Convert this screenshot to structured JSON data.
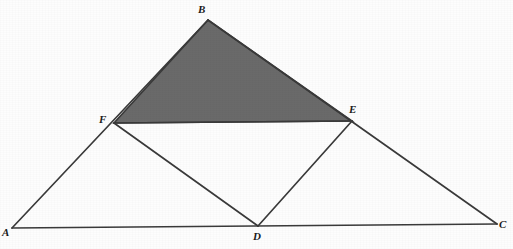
{
  "figure": {
    "kind": "geometry-diagram",
    "canvas": {
      "width": 513,
      "height": 249
    },
    "colors": {
      "background": "#fdfdfd",
      "stroke": "#3a3a3a",
      "shaded_fill": "#6a6a6a",
      "label_text": "#1a1a1a"
    },
    "points": [
      {
        "id": "A",
        "label": "A",
        "x": 12,
        "y": 228,
        "label_x": 2,
        "label_y": 227,
        "role": "triangle-vertex"
      },
      {
        "id": "B",
        "label": "B",
        "x": 208,
        "y": 20,
        "label_x": 198,
        "label_y": 4,
        "role": "triangle-vertex"
      },
      {
        "id": "C",
        "label": "C",
        "x": 497,
        "y": 224,
        "label_x": 499,
        "label_y": 219,
        "role": "triangle-vertex"
      },
      {
        "id": "D",
        "label": "D",
        "x": 258,
        "y": 226,
        "label_x": 253,
        "label_y": 231,
        "role": "midpoint-of-AC"
      },
      {
        "id": "E",
        "label": "E",
        "x": 352,
        "y": 121,
        "label_x": 349,
        "label_y": 104,
        "role": "midpoint-of-BC"
      },
      {
        "id": "F",
        "label": "F",
        "x": 114,
        "y": 123,
        "label_x": 99,
        "label_y": 114,
        "role": "midpoint-of-AB"
      }
    ],
    "segments": [
      {
        "id": "AB",
        "from": "A",
        "to": "B",
        "name": "segment-ab"
      },
      {
        "id": "BC",
        "from": "B",
        "to": "C",
        "name": "segment-bc"
      },
      {
        "id": "AC",
        "from": "A",
        "to": "C",
        "name": "segment-ac"
      },
      {
        "id": "FE",
        "from": "F",
        "to": "E",
        "name": "segment-fe"
      },
      {
        "id": "FD",
        "from": "F",
        "to": "D",
        "name": "segment-fd"
      },
      {
        "id": "DE",
        "from": "D",
        "to": "E",
        "name": "segment-de"
      }
    ],
    "shaded_region": {
      "id": "BFE",
      "vertices": [
        "B",
        "F",
        "E"
      ],
      "name": "shaded-triangle-bfe"
    },
    "stroke_width": 1.6
  }
}
